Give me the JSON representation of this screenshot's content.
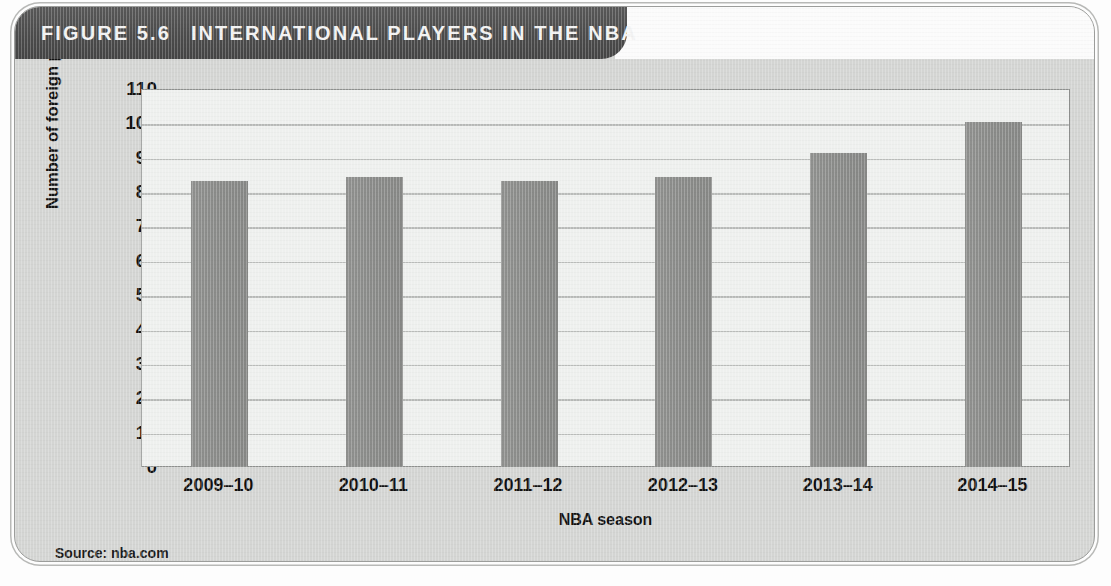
{
  "figure": {
    "number_label": "FIGURE 5.6",
    "title": "INTERNATIONAL PLAYERS IN THE NBA",
    "source": "Source: nba.com"
  },
  "colors": {
    "banner_background": "#4f4f4f",
    "banner_text": "#f2f2f2",
    "card_background": "#d4d5d3",
    "plot_background": "#eef0ee",
    "bar_fill": "#8b8c8a",
    "gridline": "#b9bbb9",
    "axis_text": "#111111"
  },
  "chart_data": {
    "type": "bar",
    "title": "INTERNATIONAL PLAYERS IN THE NBA",
    "categories": [
      "2009–10",
      "2010–11",
      "2011–12",
      "2012–13",
      "2013–14",
      "2014–15"
    ],
    "values": [
      83,
      84,
      83,
      84,
      91,
      100
    ],
    "xlabel": "NBA season",
    "ylabel": "Number of foreign players",
    "ylim": [
      0,
      110
    ],
    "ytick_step": 10,
    "yticks": [
      110,
      100,
      90,
      80,
      70,
      60,
      50,
      40,
      30,
      20,
      10,
      0
    ],
    "grid": true,
    "legend": "none",
    "source": "Source: nba.com"
  }
}
